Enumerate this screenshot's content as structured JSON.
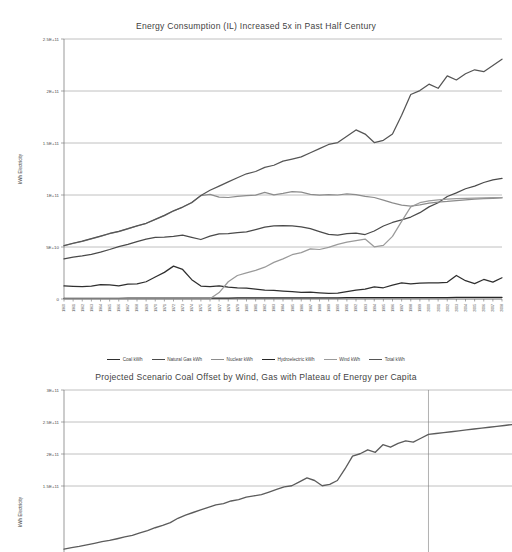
{
  "chart_data": [
    {
      "type": "line",
      "title": "Energy Consumption (IL) Increased 5x in Past Half Century",
      "xlabel": "",
      "ylabel": "kWh Electricity",
      "ylim": [
        0,
        250000000000
      ],
      "yticks": [
        0,
        50000000000,
        100000000000,
        150000000000,
        200000000000,
        250000000000
      ],
      "ytick_labels": [
        "0",
        "5E+10",
        "1E+11",
        "1.5E+11",
        "2E+11",
        "2.5E+11"
      ],
      "grid": true,
      "legend_position": "bottom",
      "x": [
        1960,
        1961,
        1962,
        1963,
        1964,
        1965,
        1966,
        1967,
        1968,
        1969,
        1970,
        1971,
        1972,
        1973,
        1974,
        1975,
        1976,
        1977,
        1978,
        1979,
        1980,
        1981,
        1982,
        1983,
        1984,
        1985,
        1986,
        1987,
        1988,
        1989,
        1990,
        1991,
        1992,
        1993,
        1994,
        1995,
        1996,
        1997,
        1998,
        1999,
        2000,
        2001,
        2002,
        2003,
        2004,
        2005,
        2006,
        2007,
        2008
      ],
      "categories": [
        "1960",
        "1961",
        "1962",
        "1963",
        "1964",
        "1965",
        "1966",
        "1967",
        "1968",
        "1969",
        "1970",
        "1971",
        "1972",
        "1973",
        "1974",
        "1975",
        "1976",
        "1977",
        "1978",
        "1979",
        "1980",
        "1981",
        "1982",
        "1983",
        "1984",
        "1985",
        "1986",
        "1987",
        "1988",
        "1989",
        "1990",
        "1991",
        "1992",
        "1993",
        "1994",
        "1995",
        "1996",
        "1997",
        "1998",
        "1999",
        "2000",
        "2001",
        "2002",
        "2003",
        "2004",
        "2005",
        "2006",
        "2007",
        "2008"
      ],
      "series": [
        {
          "name": "Coal kWh",
          "color": "#2f2f2f",
          "values": [
            12600000000,
            12200000000,
            12000000000,
            12400000000,
            13800000000,
            13600000000,
            12600000000,
            14200000000,
            14600000000,
            16600000000,
            21200000000,
            25600000000,
            31600000000,
            28400000000,
            18600000000,
            12400000000,
            11800000000,
            12600000000,
            11400000000,
            10600000000,
            10400000000,
            9600000000,
            8600000000,
            8200000000,
            7600000000,
            7000000000,
            6400000000,
            6600000000,
            6000000000,
            5400000000,
            5600000000,
            7000000000,
            8600000000,
            9400000000,
            11600000000,
            10800000000,
            13400000000,
            15400000000,
            14600000000,
            15200000000,
            15600000000,
            15400000000,
            16000000000,
            22600000000,
            17600000000,
            14800000000,
            18800000000,
            16200000000,
            20400000000
          ]
        },
        {
          "name": "Natural Gas kWh",
          "color": "#4a4a4a",
          "values": [
            38600000000,
            40200000000,
            41400000000,
            43000000000,
            45000000000,
            47600000000,
            50400000000,
            52600000000,
            55200000000,
            57600000000,
            59200000000,
            59400000000,
            60200000000,
            61400000000,
            59200000000,
            57200000000,
            60400000000,
            62600000000,
            62800000000,
            63800000000,
            64600000000,
            66800000000,
            69200000000,
            70200000000,
            70600000000,
            70200000000,
            69400000000,
            67600000000,
            64800000000,
            62200000000,
            61400000000,
            62800000000,
            63400000000,
            62000000000,
            65400000000,
            70200000000,
            73600000000,
            76000000000,
            78800000000,
            83000000000,
            88600000000,
            92600000000,
            98600000000,
            102000000000,
            106000000000,
            108600000000,
            112000000000,
            114600000000,
            116000000000
          ]
        },
        {
          "name": "Nuclear kWh",
          "color": "#8c8c8c",
          "values": [
            51200000000,
            53400000000,
            55400000000,
            57800000000,
            60200000000,
            62800000000,
            64800000000,
            67400000000,
            70200000000,
            72600000000,
            76400000000,
            80200000000,
            84600000000,
            88200000000,
            92600000000,
            99400000000,
            100600000000,
            98000000000,
            97600000000,
            98600000000,
            99400000000,
            99800000000,
            102600000000,
            100200000000,
            101600000000,
            103200000000,
            102800000000,
            100600000000,
            99800000000,
            100400000000,
            100000000000,
            101000000000,
            100400000000,
            98600000000,
            97600000000,
            95000000000,
            92400000000,
            90200000000,
            89400000000,
            90600000000,
            92200000000,
            93200000000,
            93800000000,
            94600000000,
            95400000000,
            96000000000,
            96400000000,
            96800000000,
            97200000000
          ]
        },
        {
          "name": "Hydroelectric kWh",
          "color": "#272727",
          "values": [
            600000000,
            620000000,
            640000000,
            660000000,
            680000000,
            700000000,
            720000000,
            740000000,
            760000000,
            780000000,
            800000000,
            820000000,
            840000000,
            860000000,
            880000000,
            900000000,
            920000000,
            940000000,
            960000000,
            980000000,
            1000000000,
            1020000000,
            1040000000,
            1060000000,
            1080000000,
            1100000000,
            1120000000,
            1140000000,
            1160000000,
            1180000000,
            1200000000,
            1220000000,
            1240000000,
            1260000000,
            1280000000,
            1300000000,
            1320000000,
            1340000000,
            1360000000,
            1380000000,
            1400000000,
            1420000000,
            1440000000,
            1460000000,
            1480000000,
            1500000000,
            1520000000,
            1540000000,
            1560000000
          ]
        },
        {
          "name": "Wind kWh",
          "color": "#9a9a9a",
          "values": [
            200000000,
            200000000,
            200000000,
            200000000,
            200000000,
            200000000,
            200000000,
            200000000,
            200000000,
            200000000,
            200000000,
            200000000,
            200000000,
            200000000,
            200000000,
            200000000,
            200000000,
            6200000000,
            16600000000,
            22600000000,
            25200000000,
            27600000000,
            30600000000,
            35200000000,
            38600000000,
            42600000000,
            44600000000,
            48200000000,
            47600000000,
            49600000000,
            52600000000,
            54600000000,
            56200000000,
            57600000000,
            50200000000,
            51600000000,
            60200000000,
            74600000000,
            88600000000,
            92600000000,
            94400000000,
            95200000000,
            96000000000,
            96400000000,
            96800000000,
            97000000000,
            97200000000,
            97400000000,
            97600000000
          ]
        },
        {
          "name": "Total kWh",
          "color": "#555555",
          "values": [
            51400000000,
            53600000000,
            55600000000,
            58000000000,
            60400000000,
            63000000000,
            65000000000,
            67600000000,
            70400000000,
            72800000000,
            76600000000,
            80400000000,
            84800000000,
            88400000000,
            92800000000,
            99600000000,
            104600000000,
            108600000000,
            112600000000,
            116600000000,
            120400000000,
            122600000000,
            126600000000,
            128600000000,
            132600000000,
            134600000000,
            136600000000,
            140600000000,
            144600000000,
            148600000000,
            150400000000,
            156600000000,
            162600000000,
            158600000000,
            150400000000,
            152600000000,
            158600000000,
            176600000000,
            196600000000,
            200400000000,
            206600000000,
            202600000000,
            214600000000,
            210600000000,
            216600000000,
            220400000000,
            218600000000,
            224600000000,
            230600000000
          ]
        }
      ]
    },
    {
      "type": "line",
      "title": "Projected Scenario Coal Offset by Wind, Gas with Plateau of Energy per Capita",
      "xlabel": "",
      "ylabel": "kWh Electricity",
      "ylim": [
        0,
        300000000000
      ],
      "yticks": [
        150000000000,
        200000000000,
        250000000000,
        300000000000
      ],
      "ytick_labels": [
        "1.5E+11",
        "2E+11",
        "2.5E+11",
        "3E+11"
      ],
      "grid": true,
      "projection_divider_x": 2008,
      "series": [
        {
          "name": "Total kWh",
          "color": "#5c5c5c",
          "values": [
            51400000000,
            53600000000,
            55600000000,
            58000000000,
            60400000000,
            63000000000,
            65000000000,
            67600000000,
            70400000000,
            72800000000,
            76600000000,
            80400000000,
            84800000000,
            88400000000,
            92800000000,
            99600000000,
            104600000000,
            108600000000,
            112600000000,
            116600000000,
            120400000000,
            122600000000,
            126600000000,
            128600000000,
            132600000000,
            134600000000,
            136600000000,
            140600000000,
            144600000000,
            148600000000,
            150400000000,
            156600000000,
            162600000000,
            158600000000,
            150400000000,
            152600000000,
            158600000000,
            176600000000,
            196600000000,
            200400000000,
            206600000000,
            202600000000,
            214600000000,
            210600000000,
            216600000000,
            220400000000,
            218600000000,
            224600000000,
            230600000000,
            232000000000,
            233400000000,
            234800000000,
            236200000000,
            237600000000,
            239000000000,
            240400000000,
            241800000000,
            243200000000,
            244600000000,
            246000000000
          ]
        }
      ]
    }
  ]
}
